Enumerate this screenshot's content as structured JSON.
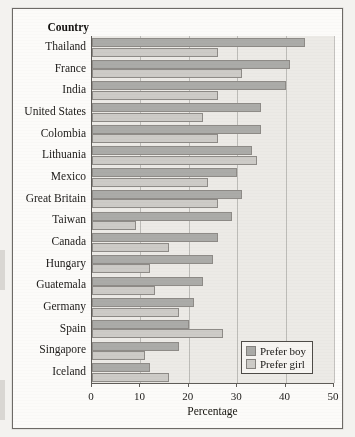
{
  "figure": {
    "y_axis_title": "Country",
    "x_axis_title": "Percentage"
  },
  "legend": {
    "items": [
      {
        "label": "Prefer boy",
        "color": "#ababa8"
      },
      {
        "label": "Prefer girl",
        "color": "#cdcbc7"
      }
    ]
  },
  "chart_data": {
    "type": "bar",
    "orientation": "horizontal",
    "title": "",
    "xlabel": "Percentage",
    "ylabel": "Country",
    "xlim": [
      0,
      50
    ],
    "xticks": [
      0,
      10,
      20,
      30,
      40,
      50
    ],
    "xticklabels": [
      "0",
      "10",
      "20",
      "30",
      "40",
      "50"
    ],
    "grid": true,
    "legend_position": "lower right",
    "categories": [
      "Thailand",
      "France",
      "India",
      "United States",
      "Colombia",
      "Lithuania",
      "Mexico",
      "Great Britain",
      "Taiwan",
      "Canada",
      "Hungary",
      "Guatemala",
      "Germany",
      "Spain",
      "Singapore",
      "Iceland"
    ],
    "series": [
      {
        "name": "Prefer boy",
        "color": "#ababa8",
        "values": [
          44,
          41,
          40,
          35,
          35,
          33,
          30,
          31,
          29,
          26,
          25,
          23,
          21,
          20,
          18,
          12
        ]
      },
      {
        "name": "Prefer girl",
        "color": "#cdcbc7",
        "values": [
          26,
          31,
          26,
          23,
          26,
          34,
          24,
          26,
          9,
          16,
          12,
          13,
          18,
          27,
          11,
          16
        ]
      }
    ]
  }
}
